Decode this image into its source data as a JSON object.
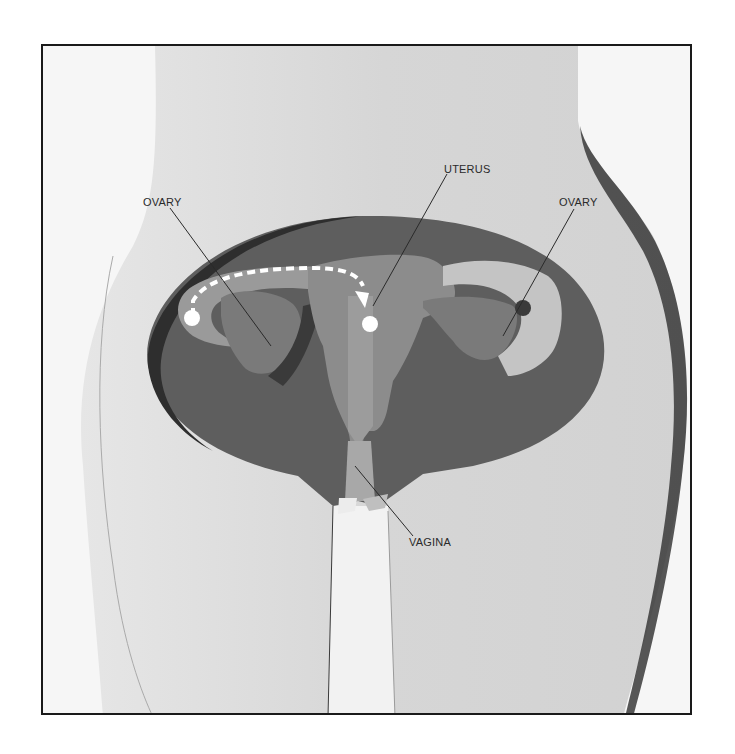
{
  "diagram": {
    "labels": {
      "ovary_left": "OVARY",
      "uterus": "UTERUS",
      "ovary_right": "OVARY",
      "vagina": "VAGINA"
    },
    "annotations": {
      "arrow": "Dashed white arrow from left ovary along fallopian tube into the uterus",
      "egg_start": "White egg at left ovary",
      "egg_end": "White egg inside uterus"
    },
    "colors": {
      "background": "#ffffff",
      "frame_border": "#1a1a1a",
      "body_skin": "#dcdcdc",
      "pelvic_cavity": "#5e5e5e",
      "organs": "#8e8e8e",
      "organs_light": "#b5b5b5",
      "egg": "#ffffff"
    }
  }
}
